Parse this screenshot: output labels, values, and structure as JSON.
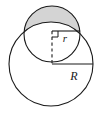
{
  "figure": {
    "type": "geometry-diagram",
    "background_color": "#ffffff",
    "stroke_color": "#1a1a1a",
    "shaded_fill_color": "#d4d4d4",
    "labels": {
      "small_radius": "r",
      "large_radius": "R"
    },
    "shapes": {
      "large_circle": {
        "name": "large-circle",
        "cx": 51,
        "cy": 64,
        "radius": 42,
        "radius_label": "R",
        "fill": "none"
      },
      "small_circle": {
        "name": "small-circle",
        "cx": 52,
        "cy": 34,
        "radius": 28,
        "radius_label": "r",
        "fill": "none"
      },
      "shaded_segment": {
        "name": "shaded-lens-region",
        "fill": "#d4d4d4",
        "note": "region inside the small circle and above the large circle's arc"
      }
    },
    "annotations": {
      "small_radius_line": {
        "name": "small-radius-line",
        "from": [
          52,
          31
        ],
        "to": [
          80,
          31
        ],
        "style": "solid"
      },
      "center_connector_line": {
        "name": "center-connector-dashed-line",
        "from": [
          52,
          31
        ],
        "to": [
          52,
          64
        ],
        "style": "dashed"
      },
      "large_radius_line": {
        "name": "large-radius-line",
        "from": [
          52,
          64
        ],
        "to": [
          93,
          64
        ],
        "style": "solid"
      },
      "right_angle_marker": {
        "name": "right-angle-marker",
        "corner": [
          52,
          31
        ],
        "size": 6
      }
    },
    "label_positions": {
      "r": {
        "x": 65,
        "y": 42
      },
      "R": {
        "x": 74,
        "y": 80
      }
    }
  }
}
